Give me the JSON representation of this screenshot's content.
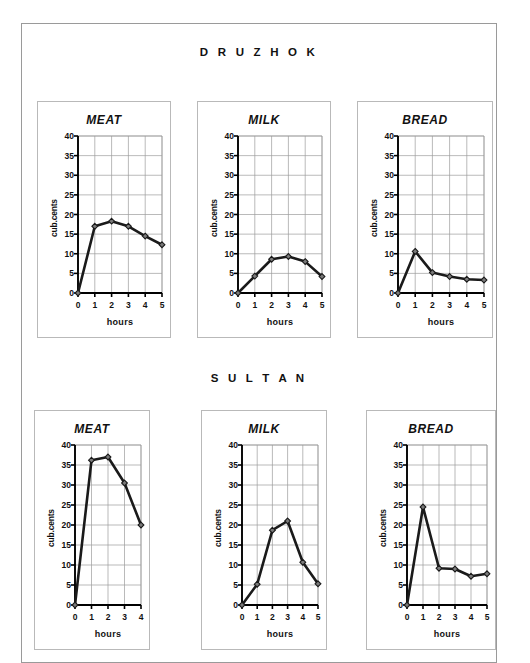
{
  "page": {
    "sections": [
      {
        "name": "druzhok",
        "title": "D R U Z H O K"
      },
      {
        "name": "sultan",
        "title": "S U L T A N"
      }
    ]
  },
  "axis": {
    "ylabel": "cub.cents",
    "xlabel": "hours",
    "yticks": [
      "40",
      "35",
      "30",
      "25",
      "20",
      "15",
      "10",
      "5",
      "0"
    ],
    "xticks_6": [
      "0",
      "1",
      "2",
      "3",
      "4",
      "5"
    ],
    "xticks_5": [
      "0",
      "1",
      "2",
      "3",
      "4"
    ]
  },
  "colors": {
    "line": "#1a1a1a",
    "grid": "#9c9c9c",
    "axis": "#000000",
    "marker_fill": "#7a7a7a",
    "panel_border": "#b9b9b9",
    "page_border": "#9a9a9a"
  },
  "chart_data": [
    {
      "type": "line",
      "title": "MEAT",
      "group": "DRUZHOK",
      "xlabel": "hours",
      "ylabel": "cub.cents",
      "x": [
        0,
        1,
        2,
        3,
        4,
        5
      ],
      "values": [
        0,
        17.0,
        18.3,
        17.0,
        14.5,
        12.3
      ],
      "xlim": [
        0,
        5
      ],
      "ylim": [
        0,
        40
      ],
      "ytick_step": 5,
      "grid": true,
      "legend": "none"
    },
    {
      "type": "line",
      "title": "MILK",
      "group": "DRUZHOK",
      "xlabel": "hours",
      "ylabel": "cub.cents",
      "x": [
        0,
        1,
        2,
        3,
        4,
        5
      ],
      "values": [
        0,
        4.3,
        8.6,
        9.3,
        8.0,
        4.2
      ],
      "xlim": [
        0,
        5
      ],
      "ylim": [
        0,
        40
      ],
      "ytick_step": 5,
      "grid": true,
      "legend": "none"
    },
    {
      "type": "line",
      "title": "BREAD",
      "group": "DRUZHOK",
      "xlabel": "hours",
      "ylabel": "cub.cents",
      "x": [
        0,
        1,
        2,
        3,
        4,
        5
      ],
      "values": [
        0,
        10.6,
        5.2,
        4.2,
        3.5,
        3.3
      ],
      "xlim": [
        0,
        5
      ],
      "ylim": [
        0,
        40
      ],
      "ytick_step": 5,
      "grid": true,
      "legend": "none"
    },
    {
      "type": "line",
      "title": "MEAT",
      "group": "SULTAN",
      "xlabel": "hours",
      "ylabel": "cub.cents",
      "x": [
        0,
        1,
        2,
        3,
        4
      ],
      "values": [
        0,
        36.2,
        37.0,
        30.5,
        20.0
      ],
      "xlim": [
        0,
        4
      ],
      "ylim": [
        0,
        40
      ],
      "ytick_step": 5,
      "grid": true,
      "legend": "none"
    },
    {
      "type": "line",
      "title": "MILK",
      "group": "SULTAN",
      "xlabel": "hours",
      "ylabel": "cub.cents",
      "x": [
        0,
        1,
        2,
        3,
        4,
        5
      ],
      "values": [
        0,
        5.2,
        18.7,
        21.0,
        10.7,
        5.3
      ],
      "xlim": [
        0,
        5
      ],
      "ylim": [
        0,
        40
      ],
      "ytick_step": 5,
      "grid": true,
      "legend": "none"
    },
    {
      "type": "line",
      "title": "BREAD",
      "group": "SULTAN",
      "xlabel": "hours",
      "ylabel": "cub.cents",
      "x": [
        0,
        1,
        2,
        3,
        4,
        5
      ],
      "values": [
        0,
        24.5,
        9.2,
        9.0,
        7.2,
        7.8
      ],
      "xlim": [
        0,
        5
      ],
      "ylim": [
        0,
        40
      ],
      "ytick_step": 5,
      "grid": true,
      "legend": "none"
    }
  ]
}
